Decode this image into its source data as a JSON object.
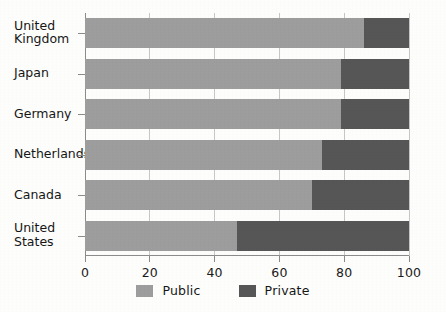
{
  "chart_data": {
    "type": "bar",
    "orientation": "horizontal",
    "stacked": true,
    "stacked_percent": true,
    "title": "",
    "subtitle": "",
    "xlabel": "",
    "ylabel": "",
    "xlim": [
      0,
      100
    ],
    "xticks": [
      0,
      20,
      40,
      60,
      80,
      100
    ],
    "xtick_labels": [
      "0",
      "20",
      "40",
      "60",
      "80",
      "100"
    ],
    "grid": false,
    "legend_position": "bottom-center",
    "categories": [
      "United Kingdom",
      "Japan",
      "Germany",
      "Netherlands",
      "Canada",
      "United States"
    ],
    "category_labels_wrapped": [
      "United\nKingdom",
      "Japan",
      "Germany",
      "Netherlands",
      "Canada",
      "United\nStates"
    ],
    "series": [
      {
        "name": "Public",
        "color": "#9d9d9d",
        "values": [
          86,
          79,
          79,
          73,
          70,
          47
        ]
      },
      {
        "name": "Private",
        "color": "#565656",
        "values": [
          14,
          21,
          21,
          27,
          30,
          53
        ]
      }
    ]
  },
  "legend": {
    "items": [
      {
        "label": "Public",
        "color": "#9d9d9d"
      },
      {
        "label": "Private",
        "color": "#565656"
      }
    ]
  },
  "colors": {
    "public": "#9d9d9d",
    "private": "#565656",
    "axis": "#8b8b8b",
    "text": "#161616",
    "background": "#fdfdfc"
  }
}
